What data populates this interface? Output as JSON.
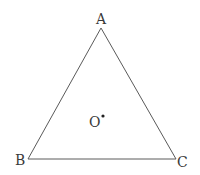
{
  "diagram": {
    "type": "triangle",
    "vertices": {
      "A": {
        "label": "A",
        "x": 101,
        "y": 28
      },
      "B": {
        "label": "B",
        "x": 28,
        "y": 159
      },
      "C": {
        "label": "C",
        "x": 176,
        "y": 159
      }
    },
    "center_point": {
      "label": "O",
      "x": 103,
      "y": 116
    },
    "colors": {
      "line": "#5a5a5a",
      "text": "#3a3a3a",
      "point": "#222222",
      "background": "#ffffff"
    }
  }
}
